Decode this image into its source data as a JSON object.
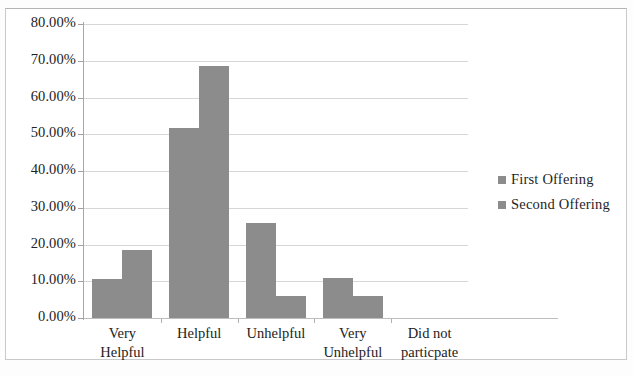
{
  "chart_data": {
    "type": "bar",
    "title": "",
    "xlabel": "",
    "ylabel": "",
    "categories": [
      "Very Helpful",
      "Helpful",
      "Unhelpful",
      "Very Unhelpful",
      "Did not particpate"
    ],
    "category_lines": [
      [
        "Very",
        "Helpful"
      ],
      [
        "Helpful",
        ""
      ],
      [
        "Unhelpful",
        ""
      ],
      [
        "Very",
        "Unhelpful"
      ],
      [
        "Did not",
        "particpate"
      ]
    ],
    "series": [
      {
        "name": "First Offering",
        "color": "#8c8c8c",
        "values": [
          10.7,
          51.7,
          25.9,
          10.9,
          0.0
        ]
      },
      {
        "name": "Second Offering",
        "color": "#8c8c8c",
        "values": [
          18.4,
          68.6,
          5.9,
          5.9,
          0.0
        ]
      }
    ],
    "ylim": [
      0,
      80
    ],
    "ytick_values": [
      0,
      10,
      20,
      30,
      40,
      50,
      60,
      70,
      80
    ],
    "ytick_labels": [
      "0.00%",
      "10.00%",
      "20.00%",
      "30.00%",
      "40.00%",
      "50.00%",
      "60.00%",
      "70.00%",
      "80.00%"
    ],
    "grid": true,
    "legend_position": "right"
  }
}
